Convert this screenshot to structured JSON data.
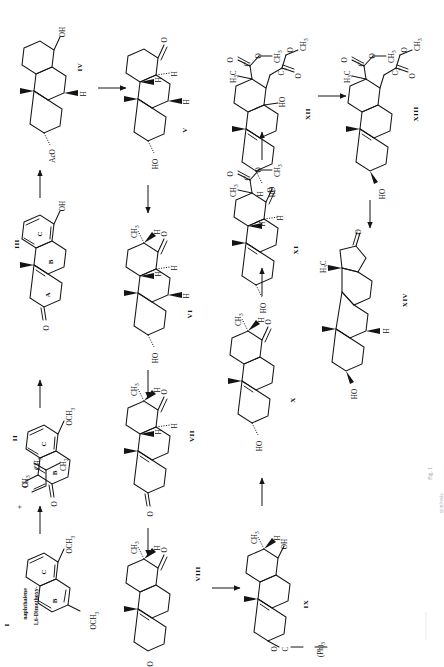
{
  "figure": {
    "domain": "scientific-scheme",
    "orientation": "rotated-90-ccw",
    "caption_line1": "Fig. 1",
    "caption_line2": "synthesis",
    "page_background": "#ffffff",
    "ink_color": "#141414"
  },
  "compounds": [
    {
      "roman": "I",
      "name_line1": "1,6-Dimethoxy-",
      "name_line2": "naphthalene",
      "labels": [
        "OCH",
        "OCH"
      ],
      "ring_letters": [
        "B",
        "C"
      ]
    },
    {
      "roman": "II",
      "labels": [
        "OCH",
        "CH",
        "O",
        "O"
      ],
      "ring_letters": [
        "B",
        "C"
      ]
    },
    {
      "roman": "III",
      "labels": [
        "OH",
        "O"
      ],
      "ring_letters": [
        "A",
        "B",
        "C"
      ]
    },
    {
      "roman": "IV",
      "labels": [
        "OH",
        "H",
        "AcO"
      ]
    },
    {
      "roman": "V",
      "labels": [
        "O",
        "H",
        "H",
        "H",
        "HO"
      ]
    },
    {
      "roman": "VI",
      "labels": [
        "CH",
        "H",
        "O",
        "H",
        "H",
        "H",
        "HO"
      ]
    },
    {
      "roman": "VII",
      "labels": [
        "CH",
        "H",
        "O",
        "H",
        "H",
        "O"
      ]
    },
    {
      "roman": "VIII",
      "labels": [
        "CH",
        "H",
        "O",
        "O"
      ]
    },
    {
      "roman": "IX",
      "labels": [
        "CH",
        "H",
        "OH",
        "O",
        "C",
        "(Ph)"
      ]
    },
    {
      "roman": "X",
      "labels": [
        "CH",
        "H",
        "O",
        "HO"
      ]
    },
    {
      "roman": "XI",
      "labels": [
        "O",
        "C",
        "O",
        "CH",
        "CH",
        "H",
        "O",
        "H",
        "H",
        "HO"
      ]
    },
    {
      "roman": "XII",
      "labels": [
        "CH",
        "CH",
        "O",
        "O",
        "O",
        "C",
        "C",
        "C",
        "H",
        "H",
        "HO",
        "HO"
      ]
    },
    {
      "roman": "XIII",
      "labels": [
        "CH",
        "CH",
        "O",
        "O",
        "O",
        "C",
        "C",
        "C",
        "H",
        "H",
        "HO"
      ]
    },
    {
      "roman": "XIV",
      "labels": [
        "O",
        "H",
        "C",
        "H",
        "HO"
      ]
    }
  ],
  "reagent": {
    "plus_sign": "+",
    "labels": [
      "CH",
      "CH",
      "O"
    ],
    "description": "methyl vinyl ketone"
  },
  "arrows": [
    {
      "from": "I",
      "to": "II",
      "direction": "up"
    },
    {
      "from": "II",
      "to": "III",
      "direction": "up"
    },
    {
      "from": "III",
      "to": "IV",
      "direction": "up"
    },
    {
      "from": "IV",
      "to": "V",
      "direction": "right"
    },
    {
      "from": "V",
      "to": "VI",
      "direction": "down"
    },
    {
      "from": "VI",
      "to": "VII",
      "direction": "down"
    },
    {
      "from": "VII",
      "to": "VIII",
      "direction": "down"
    },
    {
      "from": "VIII",
      "to": "IX",
      "direction": "right"
    },
    {
      "from": "IX",
      "to": "X",
      "direction": "up"
    },
    {
      "from": "X",
      "to": "XI",
      "direction": "up"
    },
    {
      "from": "XI",
      "to": "XII",
      "direction": "up"
    },
    {
      "from": "XII",
      "to": "XIII",
      "direction": "right"
    },
    {
      "from": "XIII",
      "to": "XIV",
      "direction": "down"
    }
  ],
  "subscripts": {
    "three": "3",
    "two": "2"
  }
}
